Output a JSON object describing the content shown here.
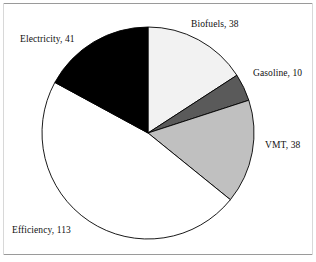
{
  "figure": {
    "background_color": "#ffffff",
    "frame_color": "#9a9a9a"
  },
  "chart_data": {
    "type": "pie",
    "title": "",
    "subtitle": "",
    "xlabel": "",
    "ylabel": "",
    "total": 240,
    "start_angle_deg": 0,
    "direction": "clockwise",
    "grid": false,
    "legend": "none",
    "labels_position": "outside",
    "categories": [
      "Biofuels",
      "Gasoline",
      "VMT",
      "Efficiency",
      "Electricity"
    ],
    "values": [
      38,
      10,
      38,
      113,
      41
    ],
    "colors": [
      "#f2f2f2",
      "#5a5a5a",
      "#c0c0c0",
      "#ffffff",
      "#000000"
    ],
    "edge_color": "#000000",
    "slices": [
      {
        "name": "Biofuels",
        "value": 38,
        "label": "Biofuels, 38",
        "color": "#f2f2f2",
        "angle_deg": 57.0,
        "percent": 15.8,
        "label_x": 191,
        "label_y": 20
      },
      {
        "name": "Gasoline",
        "value": 10,
        "label": "Gasoline, 10",
        "color": "#5a5a5a",
        "angle_deg": 15.0,
        "percent": 4.2,
        "label_x": 253,
        "label_y": 69
      },
      {
        "name": "VMT",
        "value": 38,
        "label": "VMT, 38",
        "color": "#c0c0c0",
        "angle_deg": 57.0,
        "percent": 15.8,
        "label_x": 265,
        "label_y": 141
      },
      {
        "name": "Efficiency",
        "value": 113,
        "label": "Efficiency, 113",
        "color": "#ffffff",
        "angle_deg": 169.5,
        "percent": 47.1,
        "label_x": 12,
        "label_y": 226
      },
      {
        "name": "Electricity",
        "value": 41,
        "label": "Electricity, 41",
        "color": "#000000",
        "angle_deg": 61.5,
        "percent": 17.1,
        "label_x": 20,
        "label_y": 35
      }
    ],
    "geometry": {
      "center_x": 148,
      "center_y": 133,
      "radius": 106
    }
  }
}
